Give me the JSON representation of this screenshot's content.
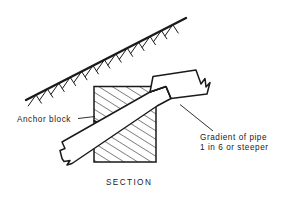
{
  "figure": {
    "caption": "SECTION",
    "background_color": "#ffffff",
    "line_color": "#1a1a1a",
    "text_color": "#1a1a1a"
  },
  "labels": {
    "anchor_block": "Anchor block",
    "gradient_line1": "Gradient of pipe",
    "gradient_line2": "1 in 6 or steeper"
  },
  "parts": {
    "ground_line": "ground-surface-hatched-slope",
    "anchor_block": "anchor-block-hatched",
    "pipe": "pipe-with-socket-collar",
    "break_symbol": "zigzag-break-line"
  }
}
